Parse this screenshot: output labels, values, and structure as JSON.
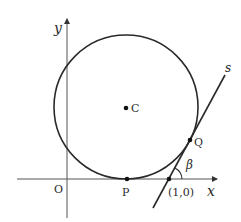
{
  "diagram": {
    "axes": {
      "x_label": "x",
      "y_label": "y",
      "origin_label": "O"
    },
    "points": {
      "center": "C",
      "tangent_x_axis": "P",
      "tangent_line": "Q",
      "x_intercept": "(1,0)"
    },
    "line_label": "s",
    "angle_label": "β",
    "colors": {
      "stroke": "#2a2a2a",
      "axis": "#555555",
      "background": "#ffffff"
    }
  }
}
